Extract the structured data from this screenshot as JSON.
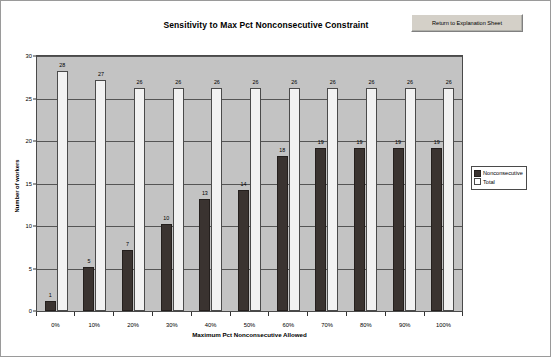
{
  "button": {
    "label": "Return to Explanation Sheet",
    "name": "return-to-explanation-sheet-button"
  },
  "legend": {
    "position": "right",
    "entries": [
      {
        "label": "Nonconsecutive",
        "marker": "filled-square",
        "color": "#3a3330"
      },
      {
        "label": "Total",
        "marker": "open-square",
        "color": "#ffffff"
      }
    ]
  },
  "colors": {
    "plot_background": "#c3c3c3",
    "nonconsecutive": "#3a3330",
    "total": "#f2f2f2",
    "gridline": "#555555",
    "axis": "#333333",
    "button_face": "#d4d0c8"
  },
  "chart_data": {
    "type": "bar",
    "title": "Sensitivity to Max Pct Nonconsecutive Constraint",
    "xlabel": "Maximum Pct Nonconsecutive Allowed",
    "ylabel": "Number of workers",
    "categories": [
      "0%",
      "10%",
      "20%",
      "30%",
      "40%",
      "50%",
      "60%",
      "70%",
      "80%",
      "90%",
      "100%"
    ],
    "series": [
      {
        "name": "Nonconsecutive",
        "values": [
          1,
          5,
          7,
          10,
          13,
          14,
          18,
          19,
          19,
          19,
          19
        ]
      },
      {
        "name": "Total",
        "values": [
          28,
          27,
          26,
          26,
          26,
          26,
          26,
          26,
          26,
          26,
          26
        ]
      }
    ],
    "ylim": [
      0,
      30
    ],
    "ytick_values": [
      0,
      5,
      10,
      15,
      20,
      25,
      30
    ],
    "ytick_labels": [
      "0",
      "5",
      "10",
      "15",
      "20",
      "25",
      "30"
    ],
    "grid": true,
    "grid_axis": "y",
    "data_labels": true,
    "legend_position": "right"
  }
}
